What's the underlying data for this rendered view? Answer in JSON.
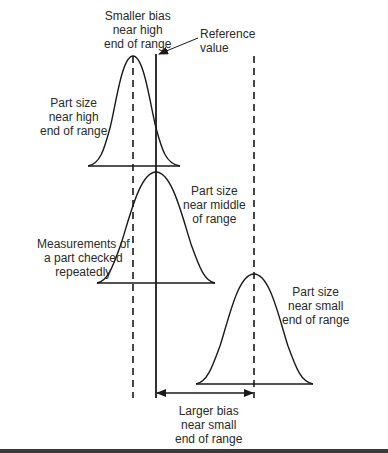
{
  "figure": {
    "type": "measurement-bias-diagram",
    "reference_line": {
      "label_lines": [
        "Reference",
        "value"
      ]
    },
    "curves": [
      {
        "id": "high",
        "label_lines": [
          "Part size",
          "near high",
          "end of range"
        ],
        "bias_label_lines": [
          "Smaller bias",
          "near high",
          "end of range"
        ]
      },
      {
        "id": "middle",
        "label_lines": [
          "Part size",
          "near middle",
          "of range"
        ]
      },
      {
        "id": "small",
        "label_lines": [
          "Part size",
          "near small",
          "end of range"
        ],
        "bias_label_lines": [
          "Larger bias",
          "near small",
          "end of range"
        ]
      }
    ],
    "annotation": {
      "label_lines": [
        "Measurements of",
        "a part checked",
        "repeatedly"
      ]
    },
    "colors": {
      "line": "#1a1a1a",
      "text": "#2a2a2a",
      "background": "#ffffff"
    }
  }
}
